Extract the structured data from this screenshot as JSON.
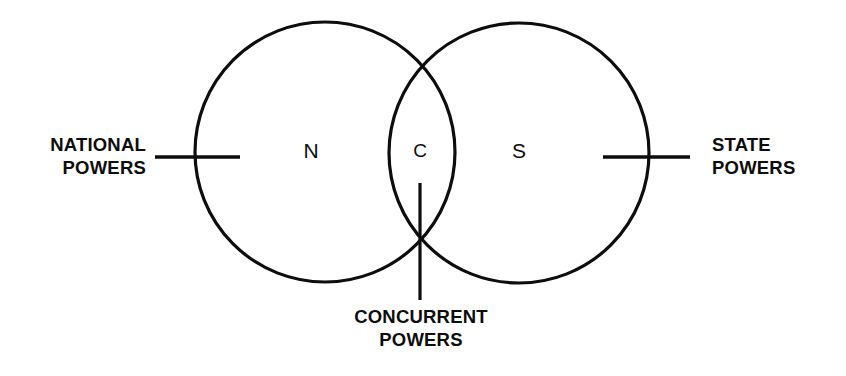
{
  "diagram": {
    "type": "venn",
    "background_color": "#ffffff",
    "stroke_color": "#0d0d0d",
    "sets": [
      {
        "id": "national",
        "letter": "N",
        "caption_line1": "NATIONAL",
        "caption_line2": "POWERS",
        "caption_side": "left"
      },
      {
        "id": "state",
        "letter": "S",
        "caption_line1": "STATE",
        "caption_line2": "POWERS",
        "caption_side": "right"
      },
      {
        "id": "concurrent",
        "letter": "C",
        "caption_line1": "CONCURRENT",
        "caption_line2": "POWERS",
        "caption_side": "bottom"
      }
    ],
    "labels": {
      "national_letter": "N",
      "state_letter": "S",
      "concurrent_letter": "C",
      "national_caption": "NATIONAL\nPOWERS",
      "state_caption": "STATE\nPOWERS",
      "concurrent_caption": "CONCURRENT\nPOWERS"
    }
  }
}
